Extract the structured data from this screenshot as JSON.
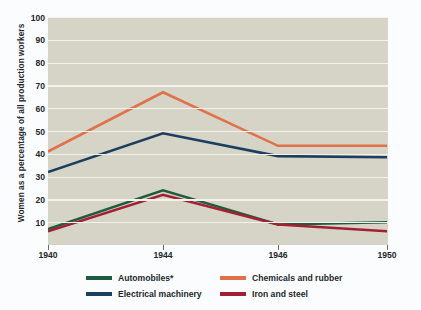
{
  "chart_data": {
    "type": "line",
    "title": "",
    "xlabel": "",
    "ylabel": "Women as a percentage of all production workers",
    "categories": [
      "1940",
      "1944",
      "1946",
      "1950"
    ],
    "x_tick_labels": [
      "1940",
      "1944",
      "1946",
      "1950"
    ],
    "y_tick_labels": [
      "100",
      "90",
      "80",
      "70",
      "60",
      "50",
      "40",
      "30",
      "20",
      "10"
    ],
    "ylim": [
      0,
      100
    ],
    "y_tick_step": 10,
    "grid": "horizontal",
    "legend_position": "bottom",
    "series": [
      {
        "name": "Automobiles*",
        "color": "#1f5c3f",
        "values": [
          7,
          24,
          9,
          10
        ]
      },
      {
        "name": "Electrical machinery",
        "color": "#1c3f61",
        "values": [
          32,
          49,
          39,
          38.5
        ]
      },
      {
        "name": "Chemicals and rubber",
        "color": "#e0714a",
        "values": [
          41,
          67,
          43.5,
          43.5
        ]
      },
      {
        "name": "Iron and steel",
        "color": "#a31f34",
        "values": [
          6,
          22,
          9,
          6
        ]
      }
    ],
    "colors": {
      "plot_background": "#d6d4c6",
      "figure_background": "#fbfcfd",
      "gridline": "#f2f1ea",
      "text": "#23282c"
    },
    "footnote_marker": "*"
  }
}
